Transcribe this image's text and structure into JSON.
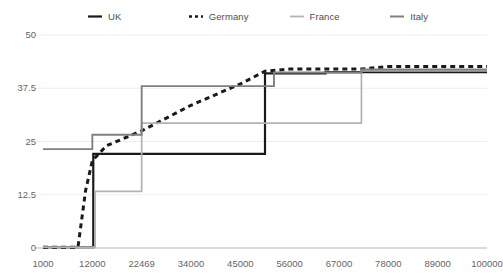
{
  "legend": {
    "position": "top",
    "items": [
      {
        "label": "UK",
        "color": "#1a1a1a",
        "style": "solid",
        "width": 2.2
      },
      {
        "label": "Germany",
        "color": "#1a1a1a",
        "style": "dotted",
        "width": 2.6
      },
      {
        "label": "France",
        "color": "#b3b3b3",
        "style": "solid",
        "width": 1.6
      },
      {
        "label": "Italy",
        "color": "#808080",
        "style": "solid",
        "width": 1.8
      }
    ]
  },
  "axes": {
    "y_ticks": [
      "0",
      "12.5",
      "25",
      "37.5",
      "50"
    ],
    "x_ticks": [
      "1000",
      "12000",
      "22469",
      "34000",
      "45000",
      "56000",
      "67000",
      "78000",
      "89000",
      "100000"
    ]
  },
  "chart_data": {
    "type": "line",
    "title": "",
    "xlabel": "",
    "ylabel": "",
    "xlim": [
      1000,
      100000
    ],
    "ylim": [
      0,
      50
    ],
    "grid": true,
    "legend_position": "top",
    "x_tick_values": [
      1000,
      12000,
      22469,
      34000,
      45000,
      56000,
      67000,
      78000,
      89000,
      100000
    ],
    "y_tick_values": [
      0,
      12.5,
      25,
      37.5,
      50
    ],
    "series": [
      {
        "name": "UK",
        "color": "#1a1a1a",
        "style": "solid",
        "interpolation": "step",
        "points": [
          [
            1000,
            0.2
          ],
          [
            12200,
            0.2
          ],
          [
            12200,
            22.1
          ],
          [
            50500,
            22.1
          ],
          [
            50500,
            41.0
          ],
          [
            64000,
            41.0
          ],
          [
            64000,
            41.3
          ],
          [
            100000,
            41.3
          ]
        ]
      },
      {
        "name": "Germany",
        "color": "#1a1a1a",
        "style": "dotted",
        "interpolation": "linear",
        "points": [
          [
            1000,
            0.2
          ],
          [
            8800,
            0.2
          ],
          [
            10500,
            13.5
          ],
          [
            12000,
            20.5
          ],
          [
            15000,
            24.0
          ],
          [
            22469,
            27.5
          ],
          [
            34000,
            33.5
          ],
          [
            45000,
            38.5
          ],
          [
            50500,
            41.5
          ],
          [
            56000,
            42.0
          ],
          [
            72000,
            42.0
          ],
          [
            78000,
            42.6
          ],
          [
            100000,
            42.6
          ]
        ]
      },
      {
        "name": "France",
        "color": "#b3b3b3",
        "style": "solid",
        "interpolation": "step",
        "points": [
          [
            1000,
            0.2
          ],
          [
            12600,
            0.2
          ],
          [
            12600,
            13.3
          ],
          [
            22469,
            13.3
          ],
          [
            22469,
            29.3
          ],
          [
            72000,
            29.3
          ],
          [
            72000,
            41.6
          ],
          [
            100000,
            41.6
          ]
        ]
      },
      {
        "name": "Italy",
        "color": "#808080",
        "style": "solid",
        "interpolation": "step",
        "points": [
          [
            1000,
            23.2
          ],
          [
            12000,
            23.2
          ],
          [
            12000,
            26.6
          ],
          [
            22469,
            26.6
          ],
          [
            22469,
            38.0
          ],
          [
            52500,
            38.0
          ],
          [
            52500,
            41.2
          ],
          [
            72000,
            41.2
          ],
          [
            72000,
            41.9
          ],
          [
            100000,
            41.9
          ]
        ]
      }
    ]
  }
}
